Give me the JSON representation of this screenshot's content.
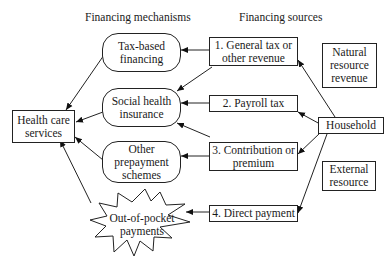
{
  "headers": {
    "mechanisms": "Financing mechanisms",
    "sources": "Financing sources"
  },
  "target": {
    "label": "Health care\nservices"
  },
  "mechanisms": [
    {
      "id": "tax",
      "label": "Tax-based\nfinancing"
    },
    {
      "id": "shi",
      "label": "Social health\ninsurance"
    },
    {
      "id": "prepay",
      "label": "Other\nprepayment\nschemes"
    },
    {
      "id": "oop",
      "label": "Out-of-pocket\npayments"
    }
  ],
  "sources": [
    {
      "id": "s1",
      "label": "1. General tax or\nother revenue"
    },
    {
      "id": "s2",
      "label": "2. Payroll tax"
    },
    {
      "id": "s3",
      "label": "3. Contribution or\npremium"
    },
    {
      "id": "s4",
      "label": "4. Direct payment"
    }
  ],
  "origins": {
    "natural": "Natural\nresource\nrevenue",
    "household": "Household",
    "external": "External\nresource"
  },
  "edges": [
    [
      "Tax-based financing",
      "Health care services"
    ],
    [
      "Social health insurance",
      "Health care services"
    ],
    [
      "Other prepayment schemes",
      "Health care services"
    ],
    [
      "Out-of-pocket payments",
      "Health care services"
    ],
    [
      "1. General tax or other revenue",
      "Tax-based financing"
    ],
    [
      "1. General tax or other revenue",
      "Social health insurance"
    ],
    [
      "2. Payroll tax",
      "Social health insurance"
    ],
    [
      "3. Contribution or premium",
      "Social health insurance"
    ],
    [
      "3. Contribution or premium",
      "Other prepayment schemes"
    ],
    [
      "4. Direct payment",
      "Out-of-pocket payments"
    ],
    [
      "Household",
      "1. General tax or other revenue"
    ],
    [
      "Household",
      "2. Payroll tax"
    ],
    [
      "Household",
      "3. Contribution or premium"
    ],
    [
      "Household",
      "4. Direct payment"
    ]
  ]
}
